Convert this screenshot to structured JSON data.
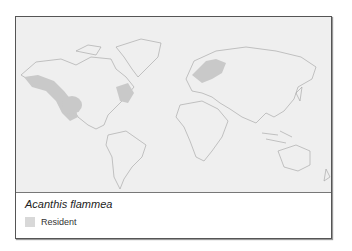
{
  "map": {
    "species": "Acanthis flammea",
    "colors": {
      "ocean": "#efefef",
      "land_outline": "#9a9a9a",
      "range": "#c9c9c9"
    }
  },
  "legend": {
    "items": [
      {
        "label": "Resident",
        "color": "#d8d8d8"
      }
    ]
  }
}
